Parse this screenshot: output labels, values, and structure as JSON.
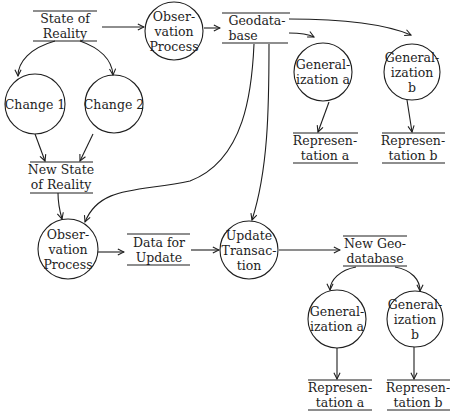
{
  "diagram": {
    "type": "data-flow",
    "colors": {
      "ink": "#1e1e1e",
      "background": "#ffffff"
    },
    "stores": {
      "state_of_reality": "State of\nReality",
      "geodatabase": "Geodata-\nbase",
      "representation_a_top": "Represen-\ntation a",
      "representation_b_top": "Represen-\ntation b",
      "new_state_of_reality": "New State\nof Reality",
      "data_for_update": "Data for\nUpdate",
      "new_geodatabase": "New Geo-\ndatabase",
      "representation_a_bottom": "Represen-\ntation a",
      "representation_b_bottom": "Represen-\ntation b"
    },
    "processes": {
      "observation_process_top": "Obser-\nvation\nProcess",
      "generalization_a_top": "General-\nization a",
      "generalization_b_top": "General-\nization b",
      "change_1": "Change 1",
      "change_2": "Change 2",
      "observation_process_bottom": "Obser-\nvation\nProcess",
      "update_transaction": "Update\nTransac-\ntion",
      "generalization_a_bottom": "General-\nization a",
      "generalization_b_bottom": "General-\nization b"
    },
    "flows": [
      [
        "State of Reality",
        "Observation Process"
      ],
      [
        "Observation Process",
        "Geodatabase"
      ],
      [
        "Geodatabase",
        "Generalization a"
      ],
      [
        "Geodatabase",
        "Generalization b"
      ],
      [
        "Generalization a",
        "Representation a"
      ],
      [
        "Generalization b",
        "Representation b"
      ],
      [
        "State of Reality",
        "Change 1"
      ],
      [
        "State of Reality",
        "Change 2"
      ],
      [
        "Change 1",
        "New State of Reality"
      ],
      [
        "Change 2",
        "New State of Reality"
      ],
      [
        "New State of Reality",
        "Observation Process"
      ],
      [
        "Geodatabase",
        "Observation Process"
      ],
      [
        "Geodatabase",
        "Update Transaction"
      ],
      [
        "Observation Process",
        "Data for Update"
      ],
      [
        "Data for Update",
        "Update Transaction"
      ],
      [
        "Update Transaction",
        "New Geodatabase"
      ],
      [
        "New Geodatabase",
        "Generalization a"
      ],
      [
        "New Geodatabase",
        "Generalization b"
      ],
      [
        "Generalization a",
        "Representation a"
      ],
      [
        "Generalization b",
        "Representation b"
      ]
    ]
  }
}
